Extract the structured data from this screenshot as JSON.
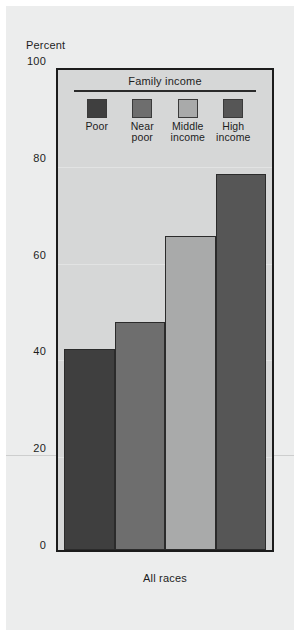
{
  "chart_data": {
    "type": "bar",
    "title": "",
    "xlabel": "All races",
    "ylabel": "Percent",
    "ylim": [
      0,
      100
    ],
    "yticks": [
      0,
      20,
      40,
      60,
      80,
      100
    ],
    "grid": true,
    "legend_position": "inside-top",
    "legend_title": "Family income",
    "categories": [
      "Poor",
      "Near poor",
      "Middle income",
      "High income"
    ],
    "series": [
      {
        "name": "All races",
        "values": [
          41.6,
          47.2,
          64.8,
          77.6
        ]
      }
    ],
    "bar_colors": [
      "#3f3f3f",
      "#6e6e6e",
      "#a9aaaa",
      "#565656"
    ],
    "plot_background": "#d6d7d7",
    "figure_background": "#eceded",
    "axis_color": "#1c1c1c"
  },
  "axis": {
    "y_title": "Percent",
    "y_ticks": [
      {
        "label": "100",
        "value": 100
      },
      {
        "label": "80",
        "value": 80
      },
      {
        "label": "60",
        "value": 60
      },
      {
        "label": "40",
        "value": 40
      },
      {
        "label": "20",
        "value": 20
      },
      {
        "label": "0",
        "value": 0
      }
    ],
    "x_label": "All races"
  },
  "legend": {
    "title": "Family income",
    "items": [
      {
        "label_line1": "Poor",
        "label_line2": "",
        "color": "#3f3f3f"
      },
      {
        "label_line1": "Near",
        "label_line2": "poor",
        "color": "#6e6e6e"
      },
      {
        "label_line1": "Middle",
        "label_line2": "income",
        "color": "#a9aaaa"
      },
      {
        "label_line1": "High",
        "label_line2": "income",
        "color": "#565656"
      }
    ]
  }
}
